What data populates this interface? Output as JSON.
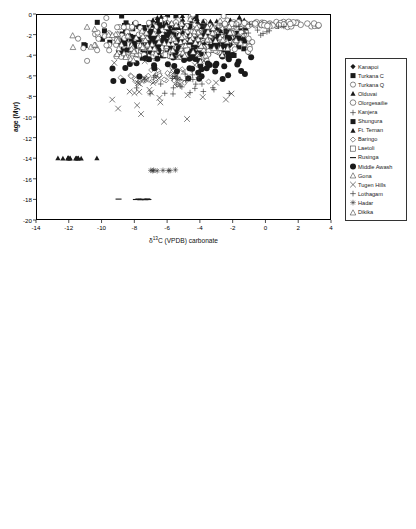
{
  "figure": {
    "panels": [
      "top",
      "bottom"
    ]
  },
  "chart_data": [
    {
      "panel": "top",
      "type": "scatter",
      "title": "",
      "xlabel": "δ¹³C (VPDB) carbonate",
      "ylabel": "age (Myr)",
      "xlim": [
        -14,
        4
      ],
      "ylim": [
        -20,
        0
      ],
      "xticks": [
        -14,
        -12,
        -10,
        -8,
        -6,
        -4,
        -2,
        0,
        2,
        4
      ],
      "yticks": [
        0,
        -2,
        -4,
        -6,
        -8,
        -10,
        -12,
        -14,
        -16,
        -18,
        -20
      ],
      "xtick_labels": [
        "-14",
        "-12",
        "-10",
        "-8",
        "-6",
        "-4",
        "-2",
        "0",
        "2",
        "4"
      ],
      "ytick_labels": [
        "0",
        "-2",
        "-4",
        "-6",
        "-8",
        "-10",
        "-12",
        "-14",
        "-16",
        "-18",
        "-20"
      ],
      "grid": false,
      "legend_position": "right",
      "reference_lines": [],
      "annotations": [],
      "series": [
        {
          "name": "Kanapoi",
          "marker": "filled-diamond",
          "color": "#1a1a1a",
          "size": 2.6,
          "n": 26,
          "x_range": [
            -12.9,
            -0.4
          ],
          "y_range": [
            -4.4,
            -1.6
          ],
          "cluster": [
            -3.4,
            -3.0
          ],
          "seed": 11
        },
        {
          "name": "Turkana C",
          "marker": "filled-square",
          "color": "#1a1a1a",
          "size": 2.5,
          "n": 210,
          "x_range": [
            -11.4,
            -1.2
          ],
          "y_range": [
            -4.6,
            -0.05
          ],
          "cluster": [
            -5.6,
            -2.6
          ],
          "seed": 23
        },
        {
          "name": "Turkana Q",
          "marker": "open-circle",
          "color": "#2a2a2a",
          "size": 2.6,
          "n": 230,
          "x_range": [
            -11.8,
            -0.6
          ],
          "y_range": [
            -4.6,
            -0.05
          ],
          "cluster": [
            -5.2,
            -2.4
          ],
          "seed": 37
        },
        {
          "name": "Olduvai",
          "marker": "filled-triangle",
          "color": "#1a1a1a",
          "size": 2.6,
          "n": 46,
          "x_range": [
            -8.5,
            -0.5
          ],
          "y_range": [
            -2.3,
            -0.05
          ],
          "cluster": [
            -4.4,
            -1.1
          ],
          "seed": 53
        },
        {
          "name": "Olorgesailie",
          "marker": "open-circle",
          "color": "#2a2a2a",
          "size": 2.8,
          "n": 64,
          "x_range": [
            -5.2,
            3.4
          ],
          "y_range": [
            -1.3,
            -0.7
          ],
          "cluster": [
            0.4,
            -1.0
          ],
          "seed": 67
        },
        {
          "name": "Kanjera",
          "marker": "plus",
          "color": "#333",
          "size": 2.8,
          "n": 22,
          "x_range": [
            -4.6,
            3.4
          ],
          "y_range": [
            -2.4,
            -0.6
          ],
          "cluster": [
            -1.6,
            -1.5
          ],
          "seed": 79
        },
        {
          "name": "Shungura",
          "marker": "filled-square",
          "color": "#1a1a1a",
          "size": 2.5,
          "n": 96,
          "x_range": [
            -9.4,
            -1.6
          ],
          "y_range": [
            -3.6,
            -1.6
          ],
          "cluster": [
            -5.4,
            -2.6
          ],
          "seed": 89
        },
        {
          "name": "Ft. Ternan",
          "marker": "filled-triangle",
          "color": "#1a1a1a",
          "size": 2.6,
          "n": 13,
          "x_range": [
            -13.2,
            -9.9
          ],
          "y_range": [
            -14.05,
            -13.95
          ],
          "cluster": [
            -12.0,
            -14.0
          ],
          "seed": 97
        },
        {
          "name": "Baringo",
          "marker": "open-diamond",
          "color": "#333",
          "size": 2.6,
          "n": 44,
          "x_range": [
            -9.1,
            -3.4
          ],
          "y_range": [
            -6.9,
            -4.5
          ],
          "cluster": [
            -6.4,
            -6.1
          ],
          "seed": 103
        },
        {
          "name": "Laetoli",
          "marker": "open-square",
          "color": "#333",
          "size": 2.6,
          "n": 30,
          "x_range": [
            -8.6,
            -2.8
          ],
          "y_range": [
            -4.4,
            -3.2
          ],
          "cluster": [
            -5.4,
            -3.6
          ],
          "seed": 113
        },
        {
          "name": "Rusinga",
          "marker": "dash",
          "color": "#1a1a1a",
          "size": 3.0,
          "n": 10,
          "x_range": [
            -9.0,
            -5.9
          ],
          "y_range": [
            -18.05,
            -17.95
          ],
          "cluster": [
            -7.4,
            -18.0
          ],
          "seed": 127
        },
        {
          "name": "Middle Awash",
          "marker": "filled-circle",
          "color": "#1a1a1a",
          "size": 3.0,
          "n": 74,
          "x_range": [
            -11.1,
            -0.5
          ],
          "y_range": [
            -6.7,
            -1.9
          ],
          "cluster": [
            -4.6,
            -4.4
          ],
          "seed": 131
        },
        {
          "name": "Gona",
          "marker": "open-triangle",
          "color": "#333",
          "size": 2.8,
          "n": 92,
          "x_range": [
            -12.4,
            -1.4
          ],
          "y_range": [
            -4.7,
            -0.3
          ],
          "cluster": [
            -5.6,
            -2.9
          ],
          "seed": 149
        },
        {
          "name": "Tugen Hills",
          "marker": "cross",
          "color": "#333",
          "size": 2.8,
          "n": 34,
          "x_range": [
            -9.4,
            -0.6
          ],
          "y_range": [
            -10.6,
            -3.3
          ],
          "cluster": [
            -6.6,
            -7.4
          ],
          "seed": 157
        },
        {
          "name": "Lothagam",
          "marker": "plus",
          "color": "#333",
          "size": 2.8,
          "n": 30,
          "x_range": [
            -8.8,
            -1.9
          ],
          "y_range": [
            -8.3,
            -5.6
          ],
          "cluster": [
            -4.6,
            -6.6
          ],
          "seed": 167
        },
        {
          "name": "Hadar",
          "marker": "star",
          "color": "#333",
          "size": 2.8,
          "n": 8,
          "x_range": [
            -7.6,
            -5.4
          ],
          "y_range": [
            -15.25,
            -15.1
          ],
          "cluster": [
            -6.6,
            -15.2
          ],
          "seed": 179
        },
        {
          "name": "Dikika",
          "marker": "open-triangle",
          "color": "#333",
          "size": 2.8,
          "n": 40,
          "x_range": [
            -8.2,
            -1.6
          ],
          "y_range": [
            -3.6,
            -0.4
          ],
          "cluster": [
            -4.4,
            -1.6
          ],
          "seed": 191
        }
      ]
    },
    {
      "panel": "bottom",
      "type": "scatter",
      "title": "",
      "xlabel": "δ¹³C (VPDB) carbonate",
      "ylabel": "age (Myr)",
      "xlim": [
        -14,
        4
      ],
      "ylim": [
        -20,
        0
      ],
      "xticks": [
        -14,
        -12,
        -10,
        -8,
        -6,
        -4,
        -2,
        0,
        2,
        4
      ],
      "yticks": [
        0,
        -2,
        -4,
        -6,
        -8,
        -10,
        -12,
        -14,
        -16,
        -18,
        -20
      ],
      "xtick_labels": [
        "-14",
        "-12",
        "-10",
        "-8",
        "-6",
        "-4",
        "-2",
        "0",
        "2",
        "4"
      ],
      "ytick_labels": [
        "0",
        "-2",
        "-4",
        "-6",
        "-8",
        "-10",
        "-12",
        "-14",
        "-16",
        "-18",
        "-20"
      ],
      "grid": false,
      "legend_position": "right",
      "reference_lines": [
        {
          "name": "c3-endmember-line",
          "axis": "x",
          "value": -9
        },
        {
          "name": "c4-endmember-line",
          "axis": "x",
          "value": 1
        }
      ],
      "annotations": [
        {
          "name": "c3-endmember-label",
          "text_main": "100% C",
          "text_sub": "3",
          "x": -9,
          "y": -19.0,
          "align": "right"
        },
        {
          "name": "c4-endmember-label",
          "text_main": "100% C",
          "text_sub": "4",
          "x": 1,
          "y": -19.0,
          "align": "left"
        }
      ],
      "series": [
        {
          "name": "Kanapoi",
          "marker": "filled-diamond",
          "color": "#1a1a1a",
          "size": 2.6,
          "n": 26,
          "x_range": [
            -12.9,
            -0.4
          ],
          "y_range": [
            -4.4,
            -1.6
          ],
          "cluster": [
            -3.4,
            -3.0
          ],
          "seed": 11
        },
        {
          "name": "Turkana C",
          "marker": "filled-square",
          "color": "#1a1a1a",
          "size": 2.5,
          "n": 210,
          "x_range": [
            -11.4,
            -1.2
          ],
          "y_range": [
            -4.6,
            -0.05
          ],
          "cluster": [
            -5.6,
            -2.6
          ],
          "seed": 23
        },
        {
          "name": "Turkana Q",
          "marker": "open-circle",
          "color": "#2a2a2a",
          "size": 2.6,
          "n": 230,
          "x_range": [
            -11.8,
            -0.6
          ],
          "y_range": [
            -4.6,
            -0.05
          ],
          "cluster": [
            -5.2,
            -2.4
          ],
          "seed": 37
        },
        {
          "name": "Olduvai",
          "marker": "filled-triangle",
          "color": "#1a1a1a",
          "size": 2.6,
          "n": 46,
          "x_range": [
            -8.5,
            -0.5
          ],
          "y_range": [
            -2.3,
            -0.05
          ],
          "cluster": [
            -4.4,
            -1.1
          ],
          "seed": 53
        },
        {
          "name": "Olorgesailie",
          "marker": "open-circle",
          "color": "#2a2a2a",
          "size": 2.8,
          "n": 64,
          "x_range": [
            -5.2,
            3.0
          ],
          "y_range": [
            -1.3,
            -0.7
          ],
          "cluster": [
            0.2,
            -1.0
          ],
          "seed": 67
        },
        {
          "name": "Shungura",
          "marker": "filled-square",
          "color": "#1a1a1a",
          "size": 2.5,
          "n": 96,
          "x_range": [
            -9.4,
            -1.6
          ],
          "y_range": [
            -3.6,
            -1.6
          ],
          "cluster": [
            -5.4,
            -2.6
          ],
          "seed": 89
        },
        {
          "name": "Ft. Ternan",
          "marker": "filled-triangle",
          "color": "#1a1a1a",
          "size": 2.6,
          "n": 13,
          "x_range": [
            -13.2,
            -9.9
          ],
          "y_range": [
            -14.05,
            -13.95
          ],
          "cluster": [
            -12.0,
            -14.0
          ],
          "seed": 97
        },
        {
          "name": "Baringo",
          "marker": "open-diamond",
          "color": "#333",
          "size": 2.6,
          "n": 44,
          "x_range": [
            -9.1,
            -3.4
          ],
          "y_range": [
            -6.9,
            -4.5
          ],
          "cluster": [
            -6.4,
            -6.1
          ],
          "seed": 103
        },
        {
          "name": "Laetoli",
          "marker": "open-square",
          "color": "#333",
          "size": 2.6,
          "n": 30,
          "x_range": [
            -8.6,
            -2.8
          ],
          "y_range": [
            -4.4,
            -3.2
          ],
          "cluster": [
            -5.4,
            -3.6
          ],
          "seed": 113
        },
        {
          "name": "Rusinga",
          "marker": "dash",
          "color": "#1a1a1a",
          "size": 3.0,
          "n": 4,
          "x_range": [
            -9.0,
            -8.2
          ],
          "y_range": [
            -18.05,
            -17.95
          ],
          "cluster": [
            -8.6,
            -18.0
          ],
          "seed": 127
        },
        {
          "name": "Middle Awash",
          "marker": "filled-circle",
          "color": "#1a1a1a",
          "size": 3.0,
          "n": 74,
          "x_range": [
            -11.1,
            -0.5
          ],
          "y_range": [
            -6.7,
            -1.9
          ],
          "cluster": [
            -4.6,
            -4.4
          ],
          "seed": 131
        },
        {
          "name": "Gona",
          "marker": "open-triangle",
          "color": "#333",
          "size": 2.8,
          "n": 92,
          "x_range": [
            -12.4,
            -1.4
          ],
          "y_range": [
            -4.7,
            -0.3
          ],
          "cluster": [
            -5.6,
            -2.9
          ],
          "seed": 149
        },
        {
          "name": "Lothagam",
          "marker": "plus",
          "color": "#333",
          "size": 2.8,
          "n": 30,
          "x_range": [
            -8.8,
            -1.9
          ],
          "y_range": [
            -8.3,
            -5.6
          ],
          "cluster": [
            -4.6,
            -6.6
          ],
          "seed": 167
        },
        {
          "name": "Hadar",
          "marker": "star",
          "color": "#333",
          "size": 2.8,
          "n": 3,
          "x_range": [
            -9.2,
            -8.9
          ],
          "y_range": [
            -9.4,
            -9.3
          ],
          "cluster": [
            -9.0,
            -9.35
          ],
          "seed": 179
        },
        {
          "name": "Dikika",
          "marker": "open-triangle",
          "color": "#333",
          "size": 2.8,
          "n": 40,
          "x_range": [
            -8.2,
            -1.6
          ],
          "y_range": [
            -3.6,
            -0.4
          ],
          "cluster": [
            -4.4,
            -1.6
          ],
          "seed": 191
        }
      ]
    }
  ]
}
